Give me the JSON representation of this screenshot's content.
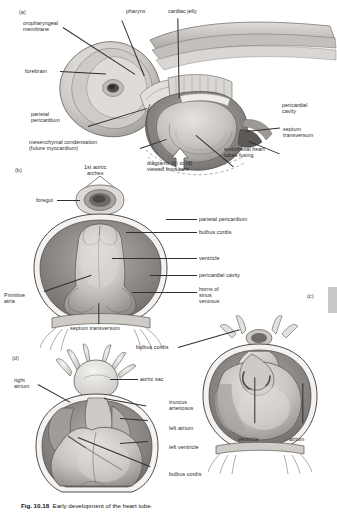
{
  "figure": {
    "number": "Fig. 10.18",
    "caption": "Early development of the heart tube.",
    "panel_markers": [
      "(a)",
      "(b)",
      "(c)",
      "(d)"
    ]
  },
  "panel_a": {
    "marker": "(a)",
    "labels": [
      {
        "id": "oropharyngeal-membrane",
        "text": "oropharyngeal\nmembrane"
      },
      {
        "id": "pharynx",
        "text": "pharynx"
      },
      {
        "id": "cardiac-jelly",
        "text": "cardiac jelly"
      },
      {
        "id": "forebrain",
        "text": "forebrain"
      },
      {
        "id": "parietal-pericardium",
        "text": "parietal\npericardium"
      },
      {
        "id": "mesenchymal-condensation",
        "text": "mesenchymal condensation\n(future myocardium)"
      },
      {
        "id": "pericardial-cavity",
        "text": "pericardial\ncavity"
      },
      {
        "id": "septum-transversum",
        "text": "septum\ntransversum"
      },
      {
        "id": "endothelial-heart-tubes-fusing",
        "text": "endothelial heart\ntubes fusing"
      },
      {
        "id": "viewing-direction",
        "text": "diagrams (b) to (d)\nviewed from here"
      }
    ]
  },
  "panel_b": {
    "marker": "(b)",
    "labels": [
      {
        "id": "first-aortic-arches",
        "text": "1st aortic\narches"
      },
      {
        "id": "foregut",
        "text": "foregut"
      },
      {
        "id": "parietal-pericardium",
        "text": "parietal pericardium"
      },
      {
        "id": "bulbus-cordis",
        "text": "bulbus cordis"
      },
      {
        "id": "ventricle",
        "text": "ventricle"
      },
      {
        "id": "pericardial-cavity",
        "text": "pericardial cavity"
      },
      {
        "id": "horns-of-sinus-venosus",
        "text": "horns of\nsinus\nvenosus"
      },
      {
        "id": "primitive-atria",
        "text": "Primitive\natria"
      },
      {
        "id": "septum-transversum",
        "text": "septum transversum"
      }
    ]
  },
  "panel_c": {
    "marker": "(c)",
    "labels": [
      {
        "id": "bulbus-cordis",
        "text": "bulbus cordis"
      },
      {
        "id": "ventricle",
        "text": "ventricle"
      },
      {
        "id": "atrium",
        "text": "atrium"
      }
    ]
  },
  "panel_d": {
    "marker": "(d)",
    "labels": [
      {
        "id": "right-atrium",
        "text": "right\natrium"
      },
      {
        "id": "aortic-sac",
        "text": "aortic sac"
      },
      {
        "id": "truncus-arteriosus",
        "text": "truncus\narteriosus"
      },
      {
        "id": "left-atrium",
        "text": "left atrium"
      },
      {
        "id": "left-ventricle",
        "text": "left ventricle"
      },
      {
        "id": "bulbus-cordis",
        "text": "bulbus cordis"
      }
    ]
  },
  "colors": {
    "page_background": "#ffffff",
    "ink": "#2a2a2a",
    "tissue_light": "#d8d6d3",
    "tissue_mid": "#b7b4b0",
    "tissue_dark": "#8d8a87",
    "cavity_shadow": "#6f6c69",
    "outline": "#5a5754",
    "edge_tab": "#c9c9c9"
  }
}
